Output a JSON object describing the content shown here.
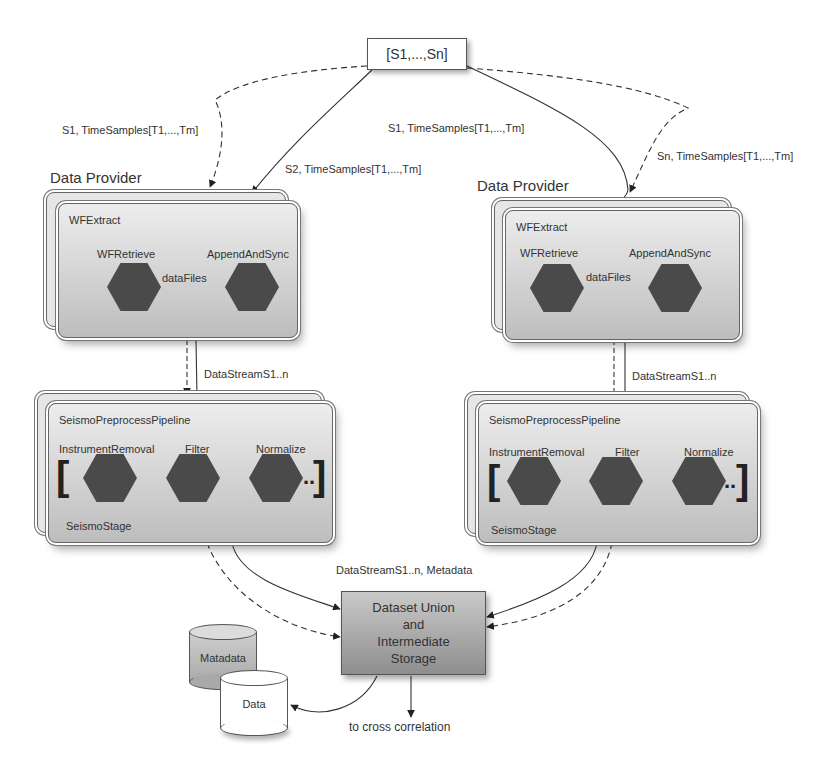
{
  "source": {
    "label": "[S1,...,Sn]"
  },
  "edge_labels": {
    "left_dashed": "S1, TimeSamples[T1,...,Tm]",
    "left_solid": "S2, TimeSamples[T1,...,Tm]",
    "right_solid": "S1, TimeSamples[T1,...,Tm]",
    "right_dashed": "Sn, TimeSamples[T1,...,Tm]",
    "left_stream": "DataStreamS1..n",
    "right_stream": "DataStreamS1..n",
    "union_input": "DataStreamS1..n, Metadata",
    "output": "to cross correlation"
  },
  "providers": [
    {
      "title": "Data Provider",
      "extract": {
        "title": "WFExtract",
        "nodes": [
          "WFRetrieve",
          "AppendAndSync"
        ],
        "edge": "dataFiles"
      },
      "pipeline": {
        "title": "SeismoPreprocessPipeline",
        "nodes": [
          "InstrumentRemoval",
          "Filter",
          "Normalize"
        ],
        "open_bracket": "[",
        "close_bracket": "]",
        "ellipsis": "..",
        "stage": "SeismoStage"
      }
    },
    {
      "title": "Data Provider",
      "extract": {
        "title": "WFExtract",
        "nodes": [
          "WFRetrieve",
          "AppendAndSync"
        ],
        "edge": "dataFiles"
      },
      "pipeline": {
        "title": "SeismoPreprocessPipeline",
        "nodes": [
          "InstrumentRemoval",
          "Filter",
          "Normalize"
        ],
        "open_bracket": "[",
        "close_bracket": "]",
        "ellipsis": "..",
        "stage": "SeismoStage"
      }
    }
  ],
  "union": {
    "lines": [
      "Dataset Union",
      "and",
      "Intermediate",
      "Storage"
    ]
  },
  "stores": [
    {
      "label": "Matadata",
      "shade": "#bdbdbd"
    },
    {
      "label": "Data",
      "shade": "#ffffff"
    }
  ],
  "colors": {
    "hex_node": "#4a4a4a",
    "box_top": "#ededed",
    "box_bottom": "#bdbdbd",
    "union_top": "#c9c9c9",
    "union_bottom": "#8e8e8e"
  }
}
